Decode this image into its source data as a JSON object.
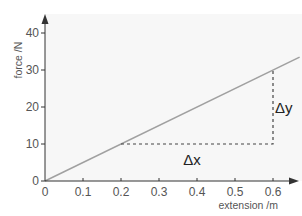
{
  "chart_data": {
    "type": "line",
    "title": "",
    "xlabel": "extension  /m",
    "ylabel": "force  /N",
    "xlim": [
      0,
      0.67
    ],
    "ylim": [
      0,
      45
    ],
    "x_ticks": [
      "0",
      "0.1",
      "0.2",
      "0.3",
      "0.4",
      "0.5",
      "0.6"
    ],
    "y_ticks": [
      "0",
      "10",
      "20",
      "30",
      "40"
    ],
    "grid": false,
    "legend": null,
    "series": [
      {
        "name": "force vs extension",
        "x": [
          0,
          0.67
        ],
        "y": [
          0,
          33.5
        ],
        "color": "#a0a0a0"
      }
    ],
    "annotations": [
      {
        "type": "dashed-triangle",
        "from": [
          0.2,
          10
        ],
        "corner": [
          0.6,
          10
        ],
        "to": [
          0.6,
          30
        ]
      },
      {
        "type": "label",
        "text": "Δx",
        "position": [
          0.4,
          10
        ],
        "placement": "below"
      },
      {
        "type": "label",
        "text": "Δy",
        "position": [
          0.6,
          20
        ],
        "placement": "right"
      }
    ]
  },
  "labels": {
    "xlabel": "extension  /m",
    "ylabel": "force  /N",
    "delta_x": "Δx",
    "delta_y": "Δy"
  },
  "colors": {
    "background": "#f7f7f7",
    "axis": "#333333",
    "line": "#a0a0a0",
    "dashed": "#444444"
  }
}
